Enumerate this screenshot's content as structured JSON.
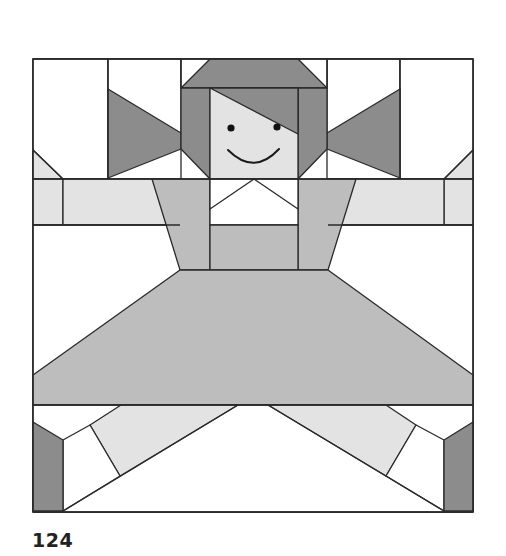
{
  "page": {
    "number": "124"
  },
  "block": {
    "subject": "girl-doll-quilt-block",
    "colors": {
      "white": "#ffffff",
      "light": "#e3e3e3",
      "medium": "#bdbdbd",
      "dark": "#8c8c8c",
      "outline": "#2a2a2a"
    }
  }
}
